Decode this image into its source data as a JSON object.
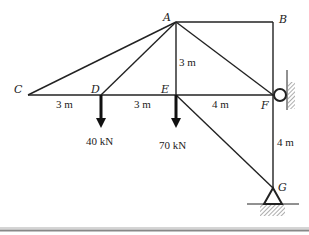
{
  "diagram": {
    "type": "truss",
    "nodes": [
      {
        "id": "A",
        "label": "A",
        "x": 176,
        "y": 22
      },
      {
        "id": "B",
        "label": "B",
        "x": 273,
        "y": 22
      },
      {
        "id": "C",
        "label": "C",
        "x": 28,
        "y": 95
      },
      {
        "id": "D",
        "label": "D",
        "x": 101,
        "y": 95
      },
      {
        "id": "E",
        "label": "E",
        "x": 176,
        "y": 95
      },
      {
        "id": "F",
        "label": "F",
        "x": 273,
        "y": 95
      },
      {
        "id": "G",
        "label": "G",
        "x": 273,
        "y": 188
      }
    ],
    "members": [
      [
        "C",
        "A"
      ],
      [
        "D",
        "A"
      ],
      [
        "E",
        "A"
      ],
      [
        "A",
        "B"
      ],
      [
        "B",
        "F"
      ],
      [
        "A",
        "F"
      ],
      [
        "C",
        "D"
      ],
      [
        "D",
        "E"
      ],
      [
        "E",
        "F"
      ],
      [
        "E",
        "G"
      ],
      [
        "F",
        "G"
      ]
    ],
    "dimensions": {
      "cd": "3 m",
      "de": "3 m",
      "ae": "3 m",
      "ef": "4 m",
      "fg": "4 m"
    },
    "loads": [
      {
        "node": "D",
        "label": "40 kN"
      },
      {
        "node": "E",
        "label": "70 kN"
      }
    ],
    "supports": [
      {
        "node": "F",
        "type": "roller-on-wall"
      },
      {
        "node": "G",
        "type": "pin"
      }
    ]
  }
}
